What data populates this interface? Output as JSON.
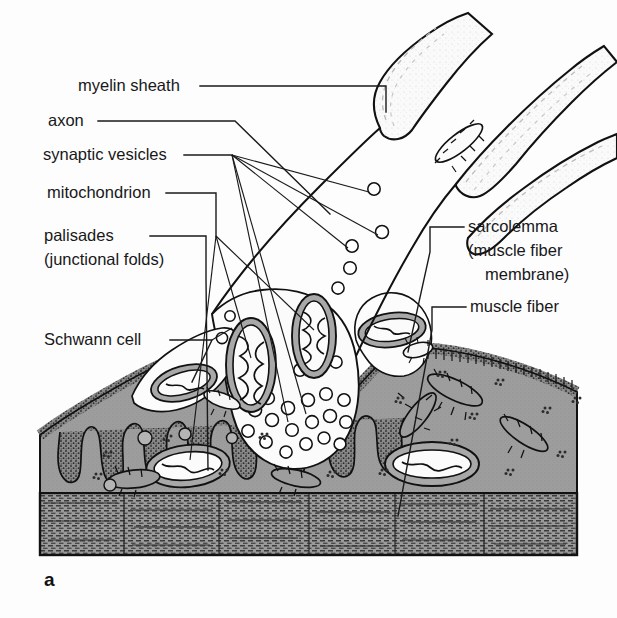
{
  "figure": {
    "panel_letter": "a",
    "title_semantic": "neuromuscular-junction",
    "background_color": "#fdfdfd"
  },
  "colors": {
    "ink": "#1a1a1a",
    "sarcoplasm_gray": "#9d9d9d",
    "membrane_stipple_gray": "#6f6f6f",
    "mitochondrion_gray": "#a8a8a8",
    "cytosol_white": "#fbfbfb",
    "striation_gray": "#8e8e8e",
    "myelin_light": "#f2f2f2"
  },
  "labels_left": [
    {
      "id": "myelin-sheath",
      "lines": [
        "myelin sheath"
      ],
      "x": 78,
      "y": 91,
      "anchor": "start"
    },
    {
      "id": "axon",
      "lines": [
        "axon"
      ],
      "x": 48,
      "y": 126,
      "anchor": "start"
    },
    {
      "id": "synaptic-vesicles",
      "lines": [
        "synaptic vesicles"
      ],
      "x": 43,
      "y": 160,
      "anchor": "start"
    },
    {
      "id": "mitochondrion",
      "lines": [
        "mitochondrion"
      ],
      "x": 47,
      "y": 198,
      "anchor": "start"
    },
    {
      "id": "palisades",
      "lines": [
        "palisades",
        "(junctional folds)"
      ],
      "x": 44,
      "y": 241,
      "anchor": "start"
    },
    {
      "id": "schwann-cell",
      "lines": [
        "Schwann cell"
      ],
      "x": 44,
      "y": 345,
      "anchor": "start"
    }
  ],
  "labels_right": [
    {
      "id": "sarcolemma",
      "lines": [
        "sarcolemma",
        "(muscle fiber",
        "membrane)"
      ],
      "x": 468,
      "y": 232,
      "anchor": "start"
    },
    {
      "id": "muscle-fiber",
      "lines": [
        "muscle fiber"
      ],
      "x": 470,
      "y": 312,
      "anchor": "start"
    }
  ],
  "structures": [
    {
      "id": "myelin-sheath",
      "description": "myelinated nerve branch, upper"
    },
    {
      "id": "axon",
      "description": "unmyelinated axon terminal branch"
    },
    {
      "id": "synaptic-vesicles",
      "description": "small clear round vesicles in terminal"
    },
    {
      "id": "mitochondrion",
      "description": "cristae-bearing organelle"
    },
    {
      "id": "palisades",
      "description": "junctional folds of sarcolemma"
    },
    {
      "id": "schwann-cell",
      "description": "glial cell capping terminal"
    },
    {
      "id": "sarcolemma",
      "description": "muscle fiber membrane, stippled"
    },
    {
      "id": "muscle-fiber",
      "description": "striated myofibril band at bottom"
    }
  ]
}
